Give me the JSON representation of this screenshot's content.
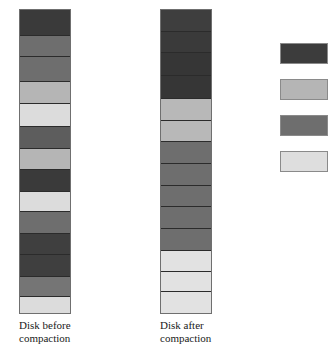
{
  "figure": {
    "colors": {
      "very_dark_gray": "#3a3a3a",
      "dark_gray": "#4f4f4f",
      "medium_gray": "#6e6e6e",
      "light_gray": "#b5b5b5",
      "very_light_gray": "#dcdcdc",
      "block_border": "#2b2b2b",
      "outline": "#6f6f6f"
    }
  },
  "disk_before": {
    "caption_line1": "Disk before",
    "caption_line2": "compaction",
    "blocks": [
      {
        "name": "block-1",
        "shade": "very_dark_gray",
        "color": "#3a3a3a",
        "height": 26
      },
      {
        "name": "block-2",
        "shade": "medium_gray",
        "color": "#6e6e6e",
        "height": 21
      },
      {
        "name": "block-3",
        "shade": "medium_gray",
        "color": "#6e6e6e",
        "height": 25
      },
      {
        "name": "block-4",
        "shade": "light_gray",
        "color": "#b5b5b5",
        "height": 23
      },
      {
        "name": "block-5",
        "shade": "very_light_gray",
        "color": "#dcdcdc",
        "height": 23
      },
      {
        "name": "block-6",
        "shade": "dark_gray",
        "color": "#5d5d5d",
        "height": 22
      },
      {
        "name": "block-7",
        "shade": "light_gray",
        "color": "#b5b5b5",
        "height": 21
      },
      {
        "name": "block-8",
        "shade": "very_dark_gray",
        "color": "#3a3a3a",
        "height": 22
      },
      {
        "name": "block-9",
        "shade": "very_light_gray",
        "color": "#dcdcdc",
        "height": 20
      },
      {
        "name": "block-10",
        "shade": "medium_gray",
        "color": "#6e6e6e",
        "height": 22
      },
      {
        "name": "block-11",
        "shade": "very_dark_gray",
        "color": "#3f3f3f",
        "height": 22
      },
      {
        "name": "block-12",
        "shade": "very_dark_gray",
        "color": "#3f3f3f",
        "height": 22
      },
      {
        "name": "block-13",
        "shade": "medium_gray",
        "color": "#757575",
        "height": 20
      },
      {
        "name": "block-14",
        "shade": "very_light_gray",
        "color": "#dcdcdc",
        "height": 16
      }
    ]
  },
  "disk_after": {
    "caption_line1": "Disk after",
    "caption_line2": "compaction",
    "blocks": [
      {
        "name": "block-1",
        "shade": "very_dark_gray",
        "color": "#3e3e3e",
        "height": 22
      },
      {
        "name": "block-2",
        "shade": "very_dark_gray",
        "color": "#3a3a3a",
        "height": 22
      },
      {
        "name": "block-3",
        "shade": "very_dark_gray",
        "color": "#363636",
        "height": 23
      },
      {
        "name": "block-4",
        "shade": "very_dark_gray",
        "color": "#363636",
        "height": 23
      },
      {
        "name": "block-5",
        "shade": "light_gray",
        "color": "#b8b8b8",
        "height": 22
      },
      {
        "name": "block-6",
        "shade": "light_gray",
        "color": "#b8b8b8",
        "height": 22
      },
      {
        "name": "block-7",
        "shade": "medium_gray",
        "color": "#6e6e6e",
        "height": 22
      },
      {
        "name": "block-8",
        "shade": "medium_gray",
        "color": "#6e6e6e",
        "height": 22
      },
      {
        "name": "block-9",
        "shade": "medium_gray",
        "color": "#6e6e6e",
        "height": 22
      },
      {
        "name": "block-10",
        "shade": "medium_gray",
        "color": "#6e6e6e",
        "height": 22
      },
      {
        "name": "block-11",
        "shade": "medium_gray",
        "color": "#6e6e6e",
        "height": 22
      },
      {
        "name": "block-12",
        "shade": "very_light_gray",
        "color": "#e2e2e2",
        "height": 21
      },
      {
        "name": "block-13",
        "shade": "very_light_gray",
        "color": "#e2e2e2",
        "height": 21
      },
      {
        "name": "block-14",
        "shade": "very_light_gray",
        "color": "#e2e2e2",
        "height": 21
      }
    ]
  },
  "legend": {
    "items": [
      {
        "name": "legend-swatch-very-dark-gray",
        "color": "#3c3c3c"
      },
      {
        "name": "legend-swatch-light-gray",
        "color": "#b5b5b5"
      },
      {
        "name": "legend-swatch-medium-gray",
        "color": "#6e6e6e"
      },
      {
        "name": "legend-swatch-very-light-gray",
        "color": "#dedede"
      }
    ]
  }
}
